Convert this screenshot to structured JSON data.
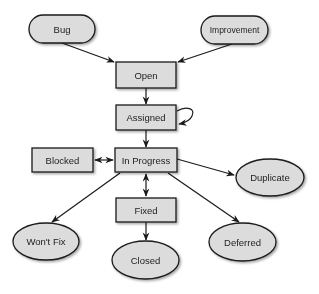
{
  "diagram": {
    "type": "state-transition",
    "colors": {
      "node_fill": "#dcdcdc",
      "node_stroke": "#1a1a1a",
      "edge": "#1a1a1a",
      "text": "#222222",
      "background": "#ffffff"
    },
    "nodes": {
      "bug": {
        "label": "Bug",
        "shape": "pill"
      },
      "improvement": {
        "label": "Improvement",
        "shape": "pill"
      },
      "open": {
        "label": "Open",
        "shape": "rect"
      },
      "assigned": {
        "label": "Assigned",
        "shape": "rect"
      },
      "blocked": {
        "label": "Blocked",
        "shape": "rect"
      },
      "in_progress": {
        "label": "In Progress",
        "shape": "rect"
      },
      "duplicate": {
        "label": "Duplicate",
        "shape": "ellipse"
      },
      "fixed": {
        "label": "Fixed",
        "shape": "rect"
      },
      "wont_fix": {
        "label": "Won't Fix",
        "shape": "ellipse"
      },
      "closed": {
        "label": "Closed",
        "shape": "ellipse"
      },
      "deferred": {
        "label": "Deferred",
        "shape": "ellipse"
      }
    },
    "edges": [
      {
        "from": "Bug",
        "to": "Open",
        "direction": "forward"
      },
      {
        "from": "Improvement",
        "to": "Open",
        "direction": "forward"
      },
      {
        "from": "Open",
        "to": "Assigned",
        "direction": "forward"
      },
      {
        "from": "Assigned",
        "to": "Assigned",
        "direction": "self-loop"
      },
      {
        "from": "Assigned",
        "to": "In Progress",
        "direction": "forward"
      },
      {
        "from": "In Progress",
        "to": "Blocked",
        "direction": "bidirectional"
      },
      {
        "from": "In Progress",
        "to": "Duplicate",
        "direction": "forward"
      },
      {
        "from": "In Progress",
        "to": "Fixed",
        "direction": "bidirectional"
      },
      {
        "from": "In Progress",
        "to": "Won't Fix",
        "direction": "forward"
      },
      {
        "from": "In Progress",
        "to": "Deferred",
        "direction": "forward"
      },
      {
        "from": "Fixed",
        "to": "Closed",
        "direction": "forward"
      }
    ]
  }
}
